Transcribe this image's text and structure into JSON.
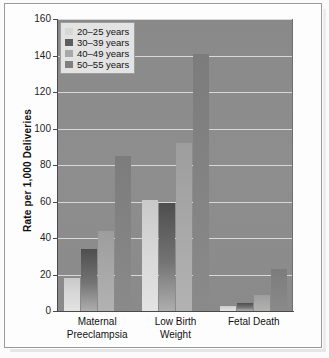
{
  "chart_data": {
    "type": "bar",
    "title": "",
    "subtitle": "",
    "xlabel": "",
    "ylabel": "Rate per 1,000 Deliveries",
    "ylim": [
      0,
      160
    ],
    "yticks": [
      0,
      20,
      40,
      60,
      80,
      100,
      120,
      140,
      160
    ],
    "ytick_labels": [
      "0",
      "20",
      "40",
      "60",
      "80",
      "100",
      "120",
      "140",
      "160"
    ],
    "grid": true,
    "legend_position": "top-left",
    "categories": [
      "Maternal Preeclampsia",
      "Low Birth Weight",
      "Fetal Death"
    ],
    "category_lines": [
      [
        "Maternal",
        "Preeclampsia"
      ],
      [
        "Low Birth",
        "Weight"
      ],
      [
        "Fetal Death"
      ]
    ],
    "series": [
      {
        "name": "20–25 years",
        "color": "#d7d7d7",
        "values": [
          18,
          61,
          3
        ]
      },
      {
        "name": "30–39 years",
        "color": "#5e5e5e",
        "values": [
          34,
          59,
          4.5
        ]
      },
      {
        "name": "40–49 years",
        "color": "#a8a8a8",
        "values": [
          44,
          92,
          9
        ]
      },
      {
        "name": "50–55 years",
        "color": "#808080",
        "values": [
          85,
          141,
          23
        ]
      }
    ],
    "plot_background": "#8b8b8b",
    "grid_color": "#d8d8d8",
    "axis_color": "#4a4a4a",
    "frame_color": "#9a9a9a"
  }
}
